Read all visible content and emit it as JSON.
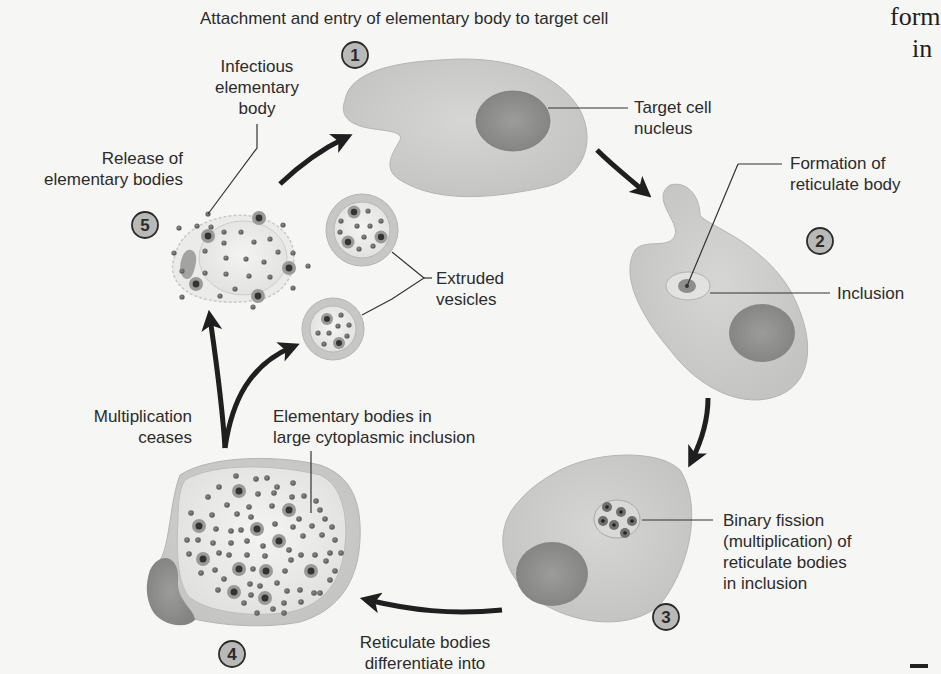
{
  "title": "Attachment and entry of elementary body to target cell",
  "side_text": [
    "form",
    "in"
  ],
  "steps": [
    {
      "number": "1"
    },
    {
      "number": "2"
    },
    {
      "number": "3"
    },
    {
      "number": "4"
    },
    {
      "number": "5"
    }
  ],
  "labels": {
    "infectious_eb": "Infectious\nelementary\nbody",
    "release_eb": "Release of\nelementary bodies",
    "target_nucleus": "Target cell\nnucleus",
    "formation_rb": "Formation of\nreticulate body",
    "inclusion": "Inclusion",
    "extruded_vesicles": "Extruded\nvesicles",
    "multiplication_ceases": "Multiplication\nceases",
    "eb_large_inclusion": "Elementary bodies in\nlarge cytoplasmic inclusion",
    "binary_fission": "Binary fission\n(multiplication) of\nreticulate bodies\nin inclusion",
    "rb_differentiate": "Reticulate bodies\ndifferentiate into"
  },
  "colors": {
    "background": "#f6f6f4",
    "cell_fill": "#c9c9c7",
    "cell_stroke": "#b5b5b3",
    "nucleus_fill": "#8f8f8d",
    "inclusion_fill": "#e8e8e6",
    "arrow": "#1f1f1f",
    "text": "#2b2b2b",
    "badge_fill": "#b9b9b7"
  }
}
